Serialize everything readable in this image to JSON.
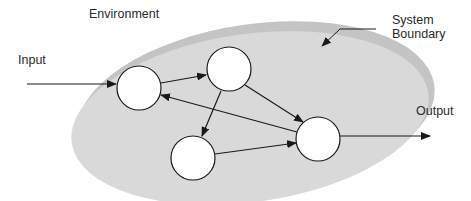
{
  "labels": {
    "environment": "Environment",
    "system_boundary_line1": "System",
    "system_boundary_line2": "Boundary",
    "input": "Input",
    "output": "Output"
  },
  "nodes": [
    {
      "id": "A",
      "cx": 139,
      "cy": 88,
      "r": 22
    },
    {
      "id": "B",
      "cx": 229,
      "cy": 69,
      "r": 22
    },
    {
      "id": "C",
      "cx": 193,
      "cy": 158,
      "r": 22
    },
    {
      "id": "D",
      "cx": 318,
      "cy": 139,
      "r": 22
    }
  ],
  "edges": [
    {
      "from": "Input",
      "to": "A"
    },
    {
      "from": "A",
      "to": "B"
    },
    {
      "from": "B",
      "to": "C"
    },
    {
      "from": "B",
      "to": "D"
    },
    {
      "from": "D",
      "to": "A"
    },
    {
      "from": "C",
      "to": "D"
    },
    {
      "from": "D",
      "to": "Output"
    }
  ],
  "colors": {
    "ellipse_fill": "#d8d8d8",
    "rim_fill": "#bdbdbd",
    "node_fill": "#ffffff",
    "stroke": "#1a1a1a"
  }
}
